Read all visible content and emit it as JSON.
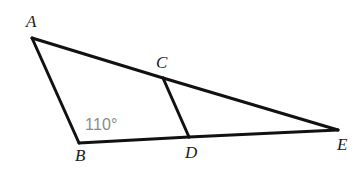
{
  "figure": {
    "background_color": "#ffffff",
    "stroke_color": "#111111",
    "stroke_width": 3,
    "label_color": "#1a1a1a",
    "angle_color": "#8a8a8a"
  },
  "points": {
    "A": {
      "label": "A",
      "x": 32,
      "y": 38
    },
    "B": {
      "label": "B",
      "x": 79,
      "y": 143
    },
    "C": {
      "label": "C",
      "x": 163,
      "y": 78
    },
    "D": {
      "label": "D",
      "x": 189,
      "y": 137
    },
    "E": {
      "label": "E",
      "x": 338,
      "y": 130
    }
  },
  "segments": [
    {
      "name": "segment-AB",
      "from": "A",
      "to": "B"
    },
    {
      "name": "segment-AC",
      "from": "A",
      "to": "C"
    },
    {
      "name": "segment-CE",
      "from": "C",
      "to": "E"
    },
    {
      "name": "segment-BD",
      "from": "B",
      "to": "D"
    },
    {
      "name": "segment-DE",
      "from": "D",
      "to": "E"
    },
    {
      "name": "segment-CD",
      "from": "C",
      "to": "D"
    }
  ],
  "annotations": {
    "angle_at_B": {
      "text": "110°",
      "value": 110,
      "unit": "degrees",
      "at_vertex": "B"
    }
  }
}
